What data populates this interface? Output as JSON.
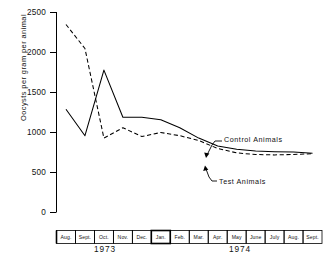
{
  "chart_data": {
    "type": "line",
    "title": "",
    "xlabel": "",
    "ylabel": "Oocysts per gram per animal",
    "ylim": [
      0,
      2500
    ],
    "yticks": [
      0,
      500,
      1000,
      1500,
      2000,
      2500
    ],
    "ytick_labels": [
      "0",
      "500",
      "1000",
      "1500",
      "2000",
      "2500"
    ],
    "grid": false,
    "legend_position": "inline-annotations",
    "categories": [
      "Aug.",
      "Sept.",
      "Oct.",
      "Nov.",
      "Dec.",
      "Jan.",
      "Feb.",
      "Mar.",
      "Apr.",
      "May",
      "June",
      "July",
      "Aug.",
      "Sept."
    ],
    "year_groups": [
      {
        "label": "1973",
        "months": [
          "Aug.",
          "Sept.",
          "Oct.",
          "Nov.",
          "Dec."
        ]
      },
      {
        "label": "1974",
        "months": [
          "Jan.",
          "Feb.",
          "Mar.",
          "Apr.",
          "May",
          "June",
          "July",
          "Aug.",
          "Sept."
        ]
      }
    ],
    "series": [
      {
        "name": "Control Animals",
        "style": "solid",
        "color": "#000000",
        "values": [
          1290,
          960,
          1780,
          1190,
          1190,
          1160,
          1060,
          930,
          830,
          790,
          770,
          760,
          755,
          740
        ]
      },
      {
        "name": "Test Animals",
        "style": "dashed",
        "color": "#000000",
        "values": [
          2350,
          2050,
          930,
          1060,
          950,
          1000,
          960,
          900,
          800,
          745,
          725,
          720,
          725,
          735
        ]
      }
    ],
    "annotations": [
      {
        "text": "Control Animals",
        "target_series": "Control Animals"
      },
      {
        "text": "Test Animals",
        "target_series": "Test Animals"
      }
    ]
  }
}
